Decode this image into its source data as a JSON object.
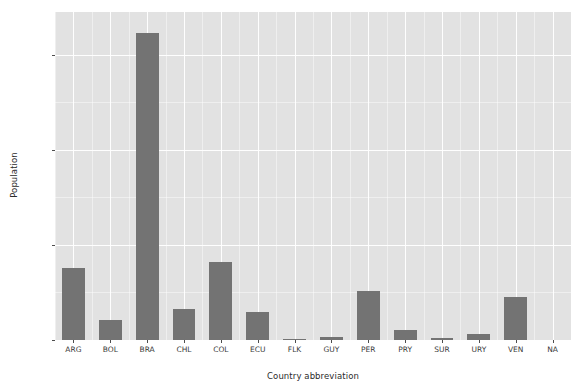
{
  "chart_data": {
    "type": "bar",
    "title": "",
    "xlabel": "Country abbreviation",
    "ylabel": "Population",
    "categories": [
      "ARG",
      "BOL",
      "BRA",
      "CHL",
      "COL",
      "ECU",
      "FLK",
      "GUY",
      "PER",
      "PRY",
      "SUR",
      "URY",
      "VEN",
      "NA"
    ],
    "values": [
      15200000000,
      4200000000,
      64600000000,
      6500000000,
      16400000000,
      5900000000,
      40000000,
      700000000,
      10300000000,
      2100000000,
      400000000,
      1300000000,
      9100000000,
      0
    ],
    "ylim": [
      0,
      69000000000
    ],
    "yticks": [
      0,
      20000000000,
      40000000000,
      60000000000
    ],
    "ytick_labels": [
      "0e+00",
      "2e+10",
      "4e+10",
      "6e+10"
    ],
    "grid": true,
    "legend": "none",
    "bar_color": "#737373",
    "panel_color": "#e2e2e2",
    "grid_color": "#ffffff"
  }
}
